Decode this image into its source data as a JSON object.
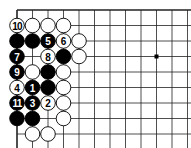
{
  "diagram": {
    "type": "go-board-corner",
    "grid": {
      "origin_x": 17,
      "origin_y": 10,
      "spacing": 15.5,
      "cols": 12,
      "rows": 9,
      "left_edge": true,
      "top_edge": true,
      "line_color": "#222222"
    },
    "star_points": [
      [
        9,
        3
      ]
    ],
    "stones": [
      {
        "col": 0,
        "row": 1,
        "color": "white",
        "label": "10"
      },
      {
        "col": 1,
        "row": 1,
        "color": "white",
        "label": ""
      },
      {
        "col": 2,
        "row": 1,
        "color": "white",
        "label": ""
      },
      {
        "col": 3,
        "row": 1,
        "color": "white",
        "label": ""
      },
      {
        "col": 0,
        "row": 2,
        "color": "black",
        "label": ""
      },
      {
        "col": 1,
        "row": 2,
        "color": "black",
        "label": ""
      },
      {
        "col": 2,
        "row": 2,
        "color": "black",
        "label": "5"
      },
      {
        "col": 3,
        "row": 2,
        "color": "white",
        "label": "6"
      },
      {
        "col": 4,
        "row": 2,
        "color": "white",
        "label": ""
      },
      {
        "col": 0,
        "row": 3,
        "color": "black",
        "label": "7"
      },
      {
        "col": 2,
        "row": 3,
        "color": "white",
        "label": "8"
      },
      {
        "col": 3,
        "row": 3,
        "color": "black",
        "label": ""
      },
      {
        "col": 4,
        "row": 3,
        "color": "white",
        "label": ""
      },
      {
        "col": 0,
        "row": 4,
        "color": "black",
        "label": "9"
      },
      {
        "col": 1,
        "row": 4,
        "color": "white",
        "label": ""
      },
      {
        "col": 2,
        "row": 4,
        "color": "black",
        "label": ""
      },
      {
        "col": 3,
        "row": 4,
        "color": "white",
        "label": ""
      },
      {
        "col": 0,
        "row": 5,
        "color": "white",
        "label": "4"
      },
      {
        "col": 1,
        "row": 5,
        "color": "black",
        "label": "1"
      },
      {
        "col": 2,
        "row": 5,
        "color": "black",
        "label": ""
      },
      {
        "col": 3,
        "row": 5,
        "color": "white",
        "label": ""
      },
      {
        "col": 0,
        "row": 6,
        "color": "black",
        "label": "11"
      },
      {
        "col": 1,
        "row": 6,
        "color": "black",
        "label": "3"
      },
      {
        "col": 2,
        "row": 6,
        "color": "white",
        "label": "2"
      },
      {
        "col": 3,
        "row": 6,
        "color": "white",
        "label": ""
      },
      {
        "col": 0,
        "row": 7,
        "color": "black",
        "label": ""
      },
      {
        "col": 1,
        "row": 7,
        "color": "black",
        "label": ""
      },
      {
        "col": 3,
        "row": 7,
        "color": "white",
        "label": ""
      },
      {
        "col": 1,
        "row": 8,
        "color": "white",
        "label": ""
      },
      {
        "col": 2,
        "row": 8,
        "color": "white",
        "label": ""
      }
    ]
  }
}
